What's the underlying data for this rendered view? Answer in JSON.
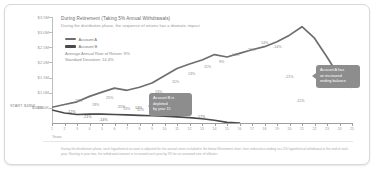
{
  "chart_data": {
    "type": "line",
    "title": "During Retirement (Taking 5% Annual Withdrawals)",
    "subtitle": "During the distribution phase, the sequence of returns has a dramatic impact",
    "xlabel": "Years",
    "ylabel": "",
    "ylim": [
      0,
      3500000
    ],
    "grid": false,
    "legend_position": "top-left",
    "start_label": "START: $485K",
    "start_value_label": "$500K",
    "ytick_labels": [
      "$3.5M",
      "$3.0M",
      "$2.5M",
      "$2.0M",
      "$1.5M",
      "$1.0M",
      "$500K"
    ],
    "ytick_values": [
      3500000,
      3000000,
      2500000,
      2000000,
      1500000,
      1000000,
      500000
    ],
    "x": [
      1,
      2,
      3,
      4,
      5,
      6,
      7,
      8,
      9,
      10,
      11,
      12,
      13,
      14,
      15,
      16,
      17,
      18,
      19,
      20,
      21,
      22,
      23,
      24,
      25
    ],
    "xtick_labels": [
      "1",
      "2",
      "3",
      "4",
      "5",
      "6",
      "7",
      "8",
      "9",
      "10",
      "11",
      "12",
      "13",
      "14",
      "15",
      "16",
      "17",
      "18",
      "19",
      "20",
      "21",
      "22",
      "23",
      "24",
      "25"
    ],
    "series": [
      {
        "name": "Account A",
        "color": "#6e6e6e",
        "values": [
          520000,
          610000,
          700000,
          880000,
          1020000,
          1150000,
          1080000,
          1180000,
          1320000,
          1560000,
          1800000,
          1950000,
          2080000,
          2260000,
          2180000,
          2300000,
          2420000,
          2520000,
          2680000,
          2900000,
          3180000,
          2800000,
          2180000,
          1520000,
          1180000
        ],
        "returns": [
          "24%",
          "19%",
          "25%",
          "13%",
          "11%",
          "13%",
          "11%",
          "13%",
          "11%",
          "9%",
          "14%",
          "21%",
          "-14%",
          "-21%",
          "-12%"
        ]
      },
      {
        "name": "Account B",
        "color": "#4a4a4a",
        "values": [
          430000,
          330000,
          280000,
          290000,
          295000,
          280000,
          270000,
          255000,
          240000,
          225000,
          200000,
          175000,
          140000,
          90000,
          20000,
          0,
          0,
          0,
          0,
          0,
          0,
          0,
          0,
          0,
          0
        ],
        "returns": [
          "-12%",
          "-21%",
          "-14%",
          "21%",
          "14%",
          "9%",
          "11%",
          "13%",
          "11%",
          "13%",
          "11%",
          "13%",
          "11%",
          "7%",
          "17%"
        ]
      }
    ],
    "annotations": [
      {
        "id": "account-b-depleted",
        "text": "Account B is depleted\nby year 15",
        "x": 15
      },
      {
        "id": "account-a-ending",
        "text": "Account A has\nan increased\nending balance",
        "x": 25
      }
    ],
    "point_labels_top": [
      {
        "t": "24%",
        "x": 23,
        "y": 82
      },
      {
        "t": "19%",
        "x": 40,
        "y": 86
      },
      {
        "t": "25%",
        "x": 54,
        "y": 79
      },
      {
        "t": "13%",
        "x": 71,
        "y": 90
      },
      {
        "t": "11%",
        "x": 85,
        "y": 91
      },
      {
        "t": "13%",
        "x": 103,
        "y": 73
      },
      {
        "t": "11%",
        "x": 120,
        "y": 63
      },
      {
        "t": "13%",
        "x": 136,
        "y": 55
      },
      {
        "t": "11%",
        "x": 152,
        "y": 48
      },
      {
        "t": "9%",
        "x": 167,
        "y": 43
      },
      {
        "t": "14%",
        "x": 180,
        "y": 36
      },
      {
        "t": "21%",
        "x": 196,
        "y": 31
      },
      {
        "t": "14%",
        "x": 209,
        "y": 24
      },
      {
        "t": "-14%",
        "x": 221,
        "y": 28
      },
      {
        "t": "-21%",
        "x": 233,
        "y": 58
      },
      {
        "t": "-12%",
        "x": 244,
        "y": 82
      }
    ],
    "point_labels_bottom": [
      {
        "t": "-12%",
        "x": 15,
        "y": 8
      },
      {
        "t": "-21%",
        "x": 31,
        "y": 13
      },
      {
        "t": "-14%",
        "x": 47,
        "y": 16
      },
      {
        "t": "21%",
        "x": 66,
        "y": 3
      },
      {
        "t": "14%",
        "x": 83,
        "y": 4
      },
      {
        "t": "9%",
        "x": 100,
        "y": 7
      },
      {
        "t": "11%",
        "x": 116,
        "y": 9
      },
      {
        "t": "13%",
        "x": 131,
        "y": 11
      },
      {
        "t": "17%",
        "x": 146,
        "y": 13
      }
    ]
  },
  "legend": {
    "items": [
      {
        "label": "Account A",
        "color": "#6e6e6e"
      },
      {
        "label": "Account B",
        "color": "#4a4a4a"
      }
    ],
    "stat_return": "Average Annual Rate of Return: 9%",
    "stat_stdev": "Standard Deviation: 14.4%"
  },
  "footnote": "During the distribution phase, each hypothetical account is adjusted for the annual return included in the below Retirement chart, then reduced according to a 5% hypothetical withdrawal at the end of each year. Starting in year two, the withdrawal amount is increased each year by 3% for an assumed rate of inflation."
}
